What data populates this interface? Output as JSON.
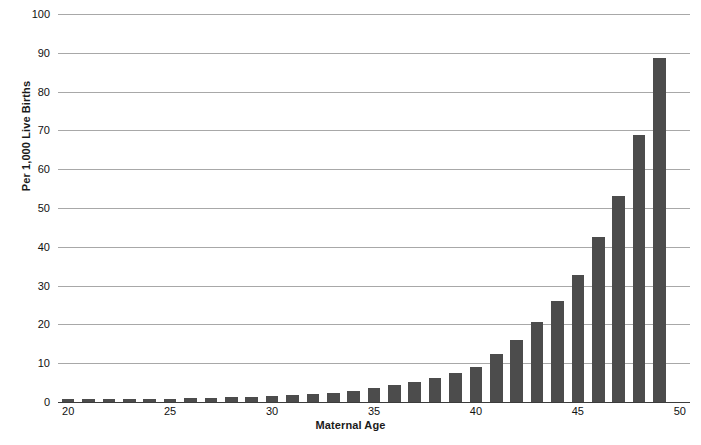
{
  "chart_data": {
    "type": "bar",
    "title": "",
    "xlabel": "Maternal Age",
    "ylabel": "Per 1,000 Live Births",
    "xlim": [
      19.5,
      50.5
    ],
    "ylim": [
      0,
      100
    ],
    "grid": true,
    "legend": false,
    "bar_color": "#4c4c4c",
    "gridline_color": "#a8a8a8",
    "background_color": "#ffffff",
    "y_ticks": [
      0,
      10,
      20,
      30,
      40,
      50,
      60,
      70,
      80,
      90,
      100
    ],
    "y_tick_labels": [
      "0",
      "10",
      "20",
      "30",
      "40",
      "50",
      "60",
      "70",
      "80",
      "90",
      "100"
    ],
    "x_ticks": [
      20,
      25,
      30,
      35,
      40,
      45,
      50
    ],
    "x_tick_labels": [
      "20",
      "25",
      "30",
      "35",
      "40",
      "45",
      "50"
    ],
    "categories": [
      20,
      21,
      22,
      23,
      24,
      25,
      26,
      27,
      28,
      29,
      30,
      31,
      32,
      33,
      34,
      35,
      36,
      37,
      38,
      39,
      40,
      41,
      42,
      43,
      44,
      45,
      46,
      47,
      48,
      49
    ],
    "values": [
      0.7,
      0.7,
      0.8,
      0.8,
      0.9,
      0.9,
      1.0,
      1.1,
      1.2,
      1.4,
      1.5,
      1.7,
      2.0,
      2.4,
      2.9,
      3.6,
      4.3,
      5.2,
      6.3,
      7.6,
      9.1,
      12.5,
      16.0,
      20.5,
      26.0,
      32.7,
      42.5,
      53.2,
      68.8,
      88.7
    ],
    "series": [
      {
        "name": "Rate per 1,000 live births",
        "values": [
          0.7,
          0.7,
          0.8,
          0.8,
          0.9,
          0.9,
          1.0,
          1.1,
          1.2,
          1.4,
          1.5,
          1.7,
          2.0,
          2.4,
          2.9,
          3.6,
          4.3,
          5.2,
          6.3,
          7.6,
          9.1,
          12.5,
          16.0,
          20.5,
          26.0,
          32.7,
          42.5,
          53.2,
          68.8,
          88.7
        ]
      }
    ]
  }
}
